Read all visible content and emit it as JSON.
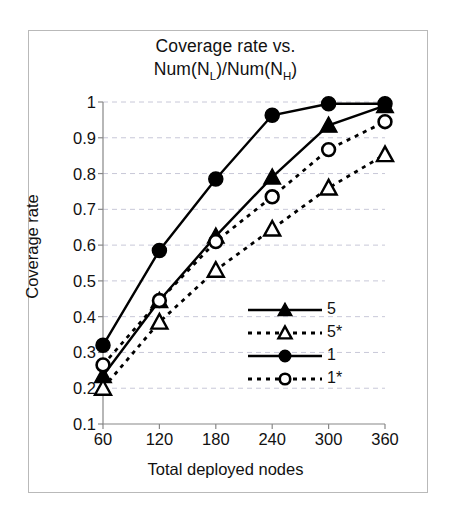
{
  "figure": {
    "border_color": "#b9b9b9",
    "background": "#ffffff",
    "axis_color": "#888888",
    "grid_color": "#c8c8d8",
    "series_color": "#000000"
  },
  "chart_data": {
    "type": "line",
    "title": "Coverage rate vs. Num(NL)/Num(NH)",
    "title_line1": "Coverage rate vs.",
    "title_line2_pre": "Num(N",
    "title_line2_sub1": "L",
    "title_line2_mid": ")/Num(N",
    "title_line2_sub2": "H",
    "title_line2_post": ")",
    "xlabel": "Total deployed nodes",
    "ylabel": "Coverage rate",
    "x": [
      60,
      120,
      180,
      240,
      300,
      360
    ],
    "xticklabels": [
      "60",
      "120",
      "180",
      "240",
      "300",
      "360"
    ],
    "yticks": [
      0.1,
      0.2,
      0.3,
      0.4,
      0.5,
      0.6,
      0.7,
      0.8,
      0.9,
      1
    ],
    "yticklabels": [
      "0.1",
      "0.2",
      "0.3",
      "0.4",
      "0.5",
      "0.6",
      "0.7",
      "0.8",
      "0.9",
      "1"
    ],
    "xlim": [
      60,
      360
    ],
    "ylim": [
      0.1,
      1.0
    ],
    "grid": "horizontal-dashed",
    "legend_position": "inside-lower-right",
    "series": [
      {
        "name": "5",
        "marker": "filled-triangle",
        "linestyle": "solid",
        "values": [
          0.235,
          0.445,
          0.625,
          0.79,
          0.935,
          0.99
        ]
      },
      {
        "name": "5*",
        "marker": "open-triangle",
        "linestyle": "dotted",
        "values": [
          0.2,
          0.385,
          0.53,
          0.645,
          0.76,
          0.853
        ]
      },
      {
        "name": "1",
        "marker": "filled-circle",
        "linestyle": "solid",
        "values": [
          0.32,
          0.585,
          0.785,
          0.963,
          0.995,
          0.995
        ]
      },
      {
        "name": "1*",
        "marker": "open-circle",
        "linestyle": "dotted",
        "values": [
          0.265,
          0.445,
          0.61,
          0.735,
          0.867,
          0.945
        ]
      }
    ]
  }
}
